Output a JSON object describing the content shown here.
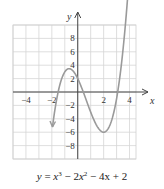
{
  "chart_data": {
    "type": "line",
    "title": "",
    "caption": "y = x³ − 2x² − 4x + 2",
    "caption_parts": {
      "y": "y",
      "eq": "=",
      "x3": "x",
      "p3": "3",
      "minus1": "−",
      "two": "2",
      "x2": "x",
      "p2": "2",
      "rest": "− 4x + 2"
    },
    "xlabel": "x",
    "ylabel": "y",
    "xlim": [
      -5,
      4.5
    ],
    "ylim": [
      -10,
      10
    ],
    "grid": true,
    "grid_step": {
      "x": 1,
      "y": 2
    },
    "x_ticks": [
      {
        "value": -4,
        "label": "−4"
      },
      {
        "value": -2,
        "label": "−2"
      },
      {
        "value": 2,
        "label": "2"
      },
      {
        "value": 4,
        "label": "4"
      }
    ],
    "y_ticks": [
      {
        "value": 8,
        "label": "8"
      },
      {
        "value": 6,
        "label": "6"
      },
      {
        "value": 4,
        "label": "4"
      },
      {
        "value": 2,
        "label": "2"
      },
      {
        "value": -2,
        "label": "−2"
      },
      {
        "value": -4,
        "label": "−4"
      },
      {
        "value": -6,
        "label": "−6"
      },
      {
        "value": -8,
        "label": "−8"
      }
    ],
    "series": [
      {
        "name": "y = x^3 - 2x^2 - 4x + 2",
        "function": "cubic",
        "coefficients": [
          1,
          -2,
          -4,
          2
        ],
        "x_domain": [
          -1.95,
          3.9
        ],
        "color": "#9a9a9a",
        "arrows_at_ends": true
      }
    ],
    "key_points": [
      {
        "label": "local max",
        "x": -0.67,
        "y": 3.48
      },
      {
        "label": "local min",
        "x": 2,
        "y": -6
      }
    ]
  }
}
